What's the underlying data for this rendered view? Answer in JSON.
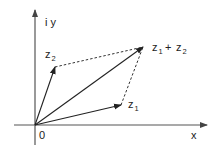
{
  "diagram": {
    "colors": {
      "axis": "#555555",
      "vector": "#222222",
      "dashed": "#333333",
      "text": "#222222"
    },
    "origin": {
      "x": 35,
      "y": 125
    },
    "axes": {
      "x_label": "x",
      "y_label": "i y",
      "origin_label": "0"
    },
    "vectors": [
      {
        "name": "z1",
        "base": "z",
        "sub": "1",
        "tip": {
          "x": 121,
          "y": 105
        }
      },
      {
        "name": "z2",
        "base": "z",
        "sub": "2",
        "tip": {
          "x": 55,
          "y": 67
        }
      },
      {
        "name": "z1+z2",
        "tip": {
          "x": 143,
          "y": 47
        }
      }
    ],
    "labels": {
      "z1": {
        "base": "z",
        "sub": "1"
      },
      "z2": {
        "base": "z",
        "sub": "2"
      },
      "sum": {
        "base1": "z",
        "sub1": "1",
        "plus": " + ",
        "base2": "z",
        "sub2": "2"
      }
    }
  }
}
